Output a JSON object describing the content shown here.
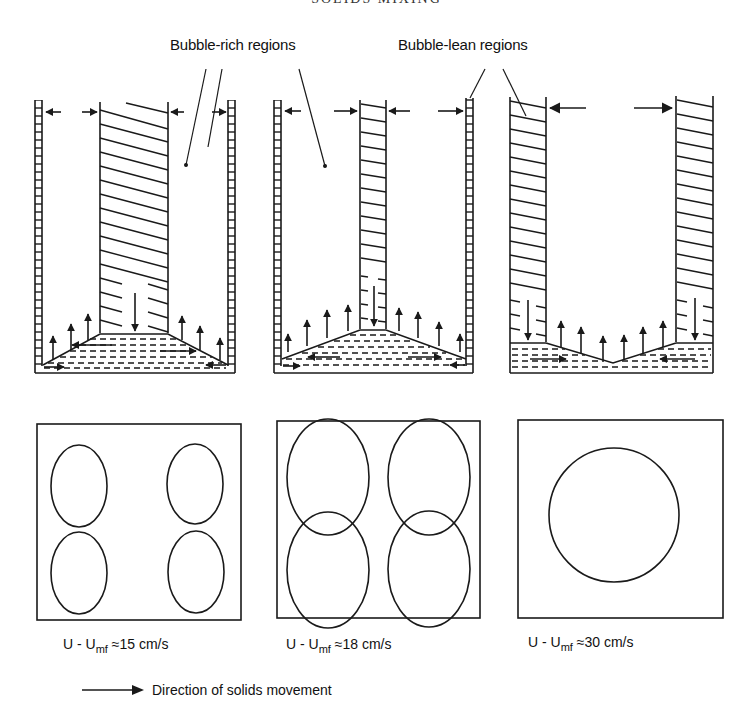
{
  "page": {
    "running_header": "SOLIDS MIXING"
  },
  "labels": {
    "bubble_rich": "Bubble-rich regions",
    "bubble_lean": "Bubble-lean regions"
  },
  "panels": [
    {
      "id": "low-velocity",
      "caption": {
        "prefix": "U - U",
        "subscript": "mf",
        "relation": "≈",
        "value": "15 cm/s"
      },
      "plan_view_bubble_count": 4,
      "plan_view_layout": "four small bubble columns at corners"
    },
    {
      "id": "medium-velocity",
      "caption": {
        "prefix": "U - U",
        "subscript": "mf",
        "relation": "≈",
        "value": "18 cm/s"
      },
      "plan_view_bubble_count": 4,
      "plan_view_layout": "four large bubble columns filling the section"
    },
    {
      "id": "high-velocity",
      "caption": {
        "prefix": "U - U",
        "subscript": "mf",
        "relation": "≈",
        "value": "30 cm/s"
      },
      "plan_view_bubble_count": 1,
      "plan_view_layout": "single large central bubble column"
    }
  ],
  "legend": {
    "arrow_icon": "right-arrow",
    "text": "Direction of solids movement"
  },
  "colors": {
    "ink": "#1a1a1a",
    "paper": "#ffffff"
  }
}
